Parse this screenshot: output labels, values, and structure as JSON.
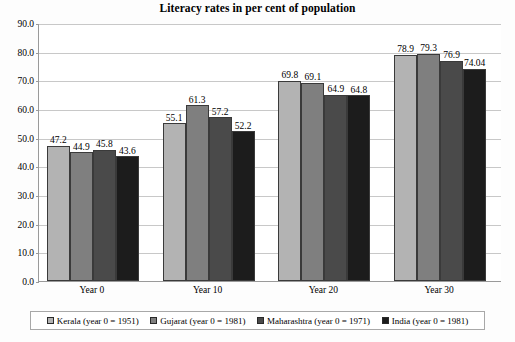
{
  "chart_data": {
    "type": "bar",
    "title": "Literacy rates in per cent of population",
    "xlabel": "",
    "ylabel": "",
    "categories": [
      "Year 0",
      "Year 10",
      "Year 20",
      "Year 30"
    ],
    "series": [
      {
        "name": "Kerala (year 0 = 1951)",
        "color": "#b3b3b3",
        "values": [
          47.2,
          55.1,
          69.8,
          78.9
        ],
        "labels": [
          "47.2",
          "55.1",
          "69.8",
          "78.9"
        ]
      },
      {
        "name": "Gujarat (year 0 = 1981)",
        "color": "#7f7f7f",
        "values": [
          44.9,
          61.3,
          69.1,
          79.3
        ],
        "labels": [
          "44.9",
          "61.3",
          "69.1",
          "79.3"
        ]
      },
      {
        "name": "Maharashtra (year 0 = 1971)",
        "color": "#4a4a4a",
        "values": [
          45.8,
          57.2,
          64.9,
          76.9
        ],
        "labels": [
          "45.8",
          "57.2",
          "64.9",
          "76.9"
        ]
      },
      {
        "name": "India (year 0 = 1981)",
        "color": "#1c1c1c",
        "values": [
          43.6,
          52.2,
          64.8,
          74.04
        ],
        "labels": [
          "43.6",
          "52.2",
          "64.8",
          "74.04"
        ]
      }
    ],
    "ylim": [
      0.0,
      90.0
    ],
    "y_ticks": [
      "0.0",
      "10.0",
      "20.0",
      "30.0",
      "40.0",
      "50.0",
      "60.0",
      "70.0",
      "80.0",
      "90.0"
    ],
    "y_tick_values": [
      0,
      10,
      20,
      30,
      40,
      50,
      60,
      70,
      80,
      90
    ],
    "grid": true,
    "legend_position": "bottom",
    "data_labels": true
  }
}
